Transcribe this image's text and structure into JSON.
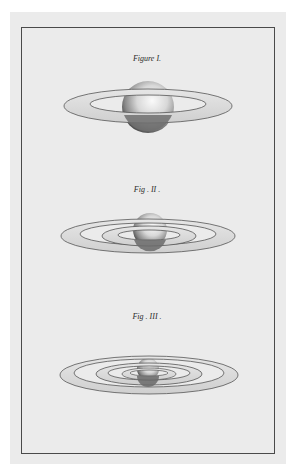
{
  "plate": {
    "background_color": "#ebebeb",
    "frame_color": "#4a4a4a",
    "figures": [
      {
        "label": "Figure I.",
        "description": "Planet with a single broad ring"
      },
      {
        "label": "Fig . II .",
        "description": "Planet with two concentric rings"
      },
      {
        "label": "Fig . III .",
        "description": "Planet with four concentric rings"
      }
    ]
  }
}
